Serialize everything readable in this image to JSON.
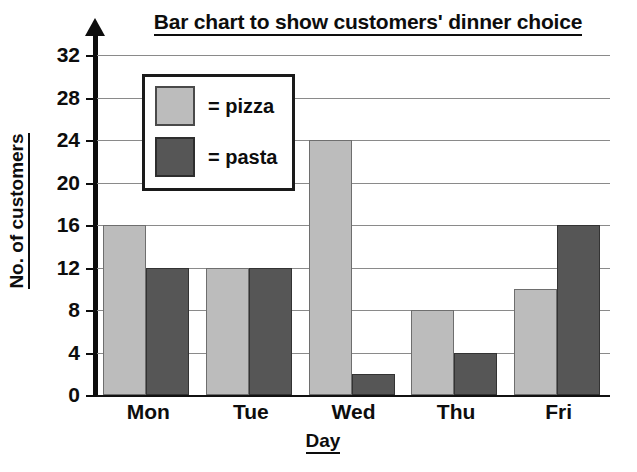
{
  "chart_data": {
    "type": "bar",
    "title": "Bar chart to show customers' dinner choice",
    "xlabel": "Day",
    "ylabel": "No. of customers",
    "categories": [
      "Mon",
      "Tue",
      "Wed",
      "Thu",
      "Fri"
    ],
    "series": [
      {
        "name": "pizza",
        "legend_label": "= pizza",
        "color": "#bcbcbc",
        "values": [
          16,
          12,
          24,
          8,
          10
        ]
      },
      {
        "name": "pasta",
        "legend_label": "= pasta",
        "color": "#565656",
        "values": [
          12,
          12,
          2,
          4,
          16
        ]
      }
    ],
    "ylim": [
      0,
      32
    ],
    "ytick_step": 4,
    "yticks": [
      "0",
      "4",
      "8",
      "12",
      "16",
      "20",
      "24",
      "28",
      "32"
    ],
    "grid": true,
    "legend_position": "upper-left-inside",
    "axis_color": "#0d0d0d",
    "grid_color": "#8a8a8a",
    "background": "#ffffff"
  }
}
